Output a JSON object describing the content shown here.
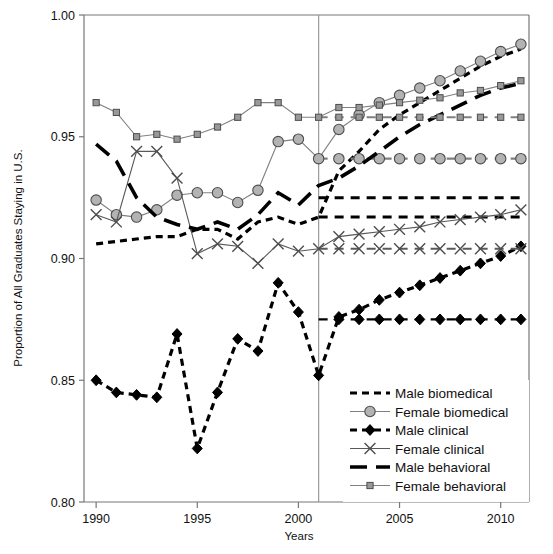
{
  "chart_data": {
    "type": "line",
    "title": "",
    "xlabel": "Years",
    "ylabel": "Proportion of All Graduates Staying in U.S.",
    "xlim": [
      1989.4,
      2011.4
    ],
    "ylim": [
      0.8,
      1.0
    ],
    "xticks": [
      1990,
      1995,
      2000,
      2005,
      2010
    ],
    "xtick_labels": [
      "1990",
      "1995",
      "2000",
      "2005",
      "2010"
    ],
    "yticks": [
      0.8,
      0.85,
      0.9,
      0.95,
      1.0
    ],
    "ytick_labels": [
      "0.80",
      "0.85",
      "0.90",
      "0.95",
      "1.00"
    ],
    "grid": false,
    "legend_position": "bottom-right",
    "reference_line": {
      "x": 2001,
      "label": "",
      "color": "#999999"
    },
    "x": [
      1990,
      1991,
      1992,
      1993,
      1994,
      1995,
      1996,
      1997,
      1998,
      1999,
      2000,
      2001,
      2002,
      2003,
      2004,
      2005,
      2006,
      2007,
      2008,
      2009,
      2010,
      2011
    ],
    "series": [
      {
        "name": "Male biomedical",
        "marker": "none",
        "line": "dashed",
        "color": "#000000",
        "values": [
          0.906,
          0.907,
          0.908,
          0.909,
          0.909,
          0.912,
          0.912,
          0.908,
          0.915,
          0.917,
          0.914,
          0.917,
          0.936,
          0.944,
          0.953,
          0.959,
          0.964,
          0.969,
          0.974,
          0.979,
          0.983,
          0.986
        ],
        "counterfactual": {
          "from": 2001,
          "to": 2011,
          "value": 0.917
        }
      },
      {
        "name": "Female biomedical",
        "marker": "circle",
        "line": "solid",
        "color": "#808080",
        "values": [
          0.924,
          0.918,
          0.917,
          0.92,
          0.926,
          0.927,
          0.927,
          0.923,
          0.928,
          0.948,
          0.949,
          0.941,
          0.953,
          0.959,
          0.964,
          0.967,
          0.97,
          0.973,
          0.977,
          0.981,
          0.985,
          0.988
        ],
        "counterfactual": {
          "from": 2001,
          "to": 2011,
          "value": 0.941
        }
      },
      {
        "name": "Male clinical",
        "marker": "diamond",
        "line": "dashed",
        "color": "#000000",
        "values": [
          0.85,
          0.845,
          0.844,
          0.843,
          0.869,
          0.822,
          0.845,
          0.867,
          0.862,
          0.89,
          0.878,
          0.852,
          0.876,
          0.879,
          0.883,
          0.886,
          0.889,
          0.892,
          0.895,
          0.898,
          0.901,
          0.905
        ],
        "counterfactual": {
          "from": 2001,
          "to": 2011,
          "value": 0.875
        }
      },
      {
        "name": "Female clinical",
        "marker": "cross",
        "line": "solid",
        "color": "#595959",
        "values": [
          0.918,
          0.915,
          0.944,
          0.944,
          0.933,
          0.902,
          0.906,
          0.905,
          0.898,
          0.906,
          0.903,
          0.904,
          0.909,
          0.91,
          0.911,
          0.912,
          0.913,
          0.915,
          0.916,
          0.917,
          0.918,
          0.92
        ],
        "counterfactual": {
          "from": 2001,
          "to": 2011,
          "value": 0.904
        }
      },
      {
        "name": "Male behavioral",
        "marker": "none",
        "line": "longdash",
        "color": "#000000",
        "values": [
          0.947,
          0.94,
          0.925,
          0.917,
          0.914,
          0.912,
          0.915,
          0.912,
          0.918,
          0.927,
          0.922,
          0.93,
          0.933,
          0.938,
          0.944,
          0.95,
          0.955,
          0.959,
          0.963,
          0.967,
          0.97,
          0.972
        ],
        "counterfactual": {
          "from": 2001,
          "to": 2011,
          "value": 0.925
        }
      },
      {
        "name": "Female behavioral",
        "marker": "square",
        "line": "solid",
        "color": "#808080",
        "values": [
          0.964,
          0.96,
          0.95,
          0.951,
          0.949,
          0.951,
          0.954,
          0.958,
          0.964,
          0.964,
          0.958,
          0.958,
          0.962,
          0.962,
          0.963,
          0.964,
          0.965,
          0.966,
          0.968,
          0.969,
          0.971,
          0.973
        ],
        "counterfactual": {
          "from": 2001,
          "to": 2011,
          "value": 0.958
        }
      }
    ]
  },
  "legend": {
    "items": [
      {
        "label": "Male biomedical"
      },
      {
        "label": "Female biomedical"
      },
      {
        "label": "Male clinical"
      },
      {
        "label": "Female clinical"
      },
      {
        "label": "Male behavioral"
      },
      {
        "label": "Female behavioral"
      }
    ]
  }
}
